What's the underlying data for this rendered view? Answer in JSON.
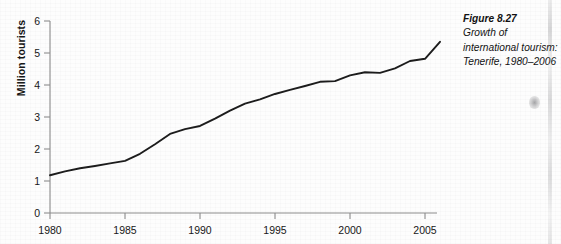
{
  "caption": {
    "figure_number": "Figure 8.27",
    "description": "Growth of international tourism: Tenerife, 1980–2006"
  },
  "chart_data": {
    "type": "line",
    "title": "",
    "xlabel": "",
    "ylabel": "Million tourists",
    "xlim": [
      1980,
      2006
    ],
    "ylim": [
      0,
      6
    ],
    "grid": false,
    "legend": null,
    "line_color": "#1b1b1b",
    "x_ticks": [
      "1980",
      "1985",
      "1990",
      "1995",
      "2000",
      "2005"
    ],
    "y_ticks": [
      "0",
      "1",
      "2",
      "3",
      "4",
      "5",
      "6"
    ],
    "x": [
      1980,
      1981,
      1982,
      1983,
      1984,
      1985,
      1986,
      1987,
      1988,
      1989,
      1990,
      1991,
      1992,
      1993,
      1994,
      1995,
      1996,
      1997,
      1998,
      1999,
      2000,
      2001,
      2002,
      2003,
      2004,
      2005,
      2006
    ],
    "values": [
      1.18,
      1.3,
      1.4,
      1.47,
      1.55,
      1.63,
      1.85,
      2.15,
      2.47,
      2.62,
      2.72,
      2.95,
      3.2,
      3.42,
      3.55,
      3.72,
      3.85,
      3.97,
      4.1,
      4.12,
      4.3,
      4.4,
      4.38,
      4.52,
      4.75,
      4.82,
      5.35
    ],
    "series": [
      {
        "name": "Million tourists",
        "values": [
          1.18,
          1.3,
          1.4,
          1.47,
          1.55,
          1.63,
          1.85,
          2.15,
          2.47,
          2.62,
          2.72,
          2.95,
          3.2,
          3.42,
          3.55,
          3.72,
          3.85,
          3.97,
          4.1,
          4.12,
          4.3,
          4.4,
          4.38,
          4.52,
          4.75,
          4.82,
          5.35
        ]
      }
    ]
  }
}
